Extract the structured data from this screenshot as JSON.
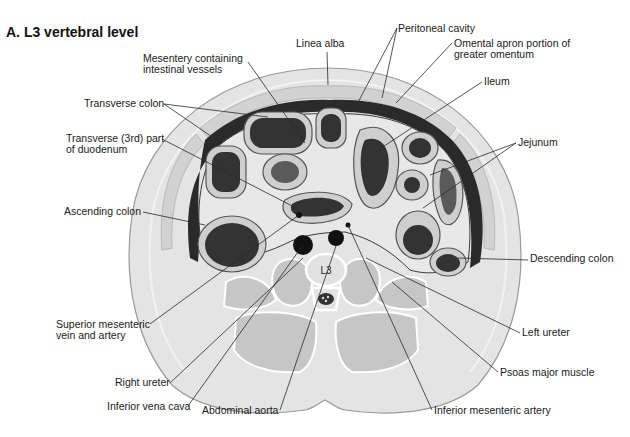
{
  "title": "A. L3 vertebral level",
  "vertebra_label": "L3",
  "labels": [
    {
      "id": "mesentery",
      "lines": [
        "Mesentery containing",
        "intestinal vessels"
      ],
      "x": 143,
      "y": 62,
      "anchor": "start"
    },
    {
      "id": "linea-alba",
      "lines": [
        "Linea alba"
      ],
      "x": 296,
      "y": 47,
      "anchor": "start"
    },
    {
      "id": "peritoneal-cavity",
      "lines": [
        "Peritoneal cavity"
      ],
      "x": 398,
      "y": 32,
      "anchor": "start"
    },
    {
      "id": "omental-apron",
      "lines": [
        "Omental apron portion of",
        "greater omentum"
      ],
      "x": 454,
      "y": 47,
      "anchor": "start"
    },
    {
      "id": "ileum",
      "lines": [
        "Ileum"
      ],
      "x": 484,
      "y": 85,
      "anchor": "start"
    },
    {
      "id": "transverse-colon",
      "lines": [
        "Transverse colon"
      ],
      "x": 84,
      "y": 107,
      "anchor": "start"
    },
    {
      "id": "duodenum",
      "lines": [
        "Transverse (3rd) part",
        "of duodenum"
      ],
      "x": 66,
      "y": 142,
      "anchor": "start"
    },
    {
      "id": "jejunum",
      "lines": [
        "Jejunum"
      ],
      "x": 518,
      "y": 146,
      "anchor": "start"
    },
    {
      "id": "ascending-colon",
      "lines": [
        "Ascending colon"
      ],
      "x": 64,
      "y": 215,
      "anchor": "start"
    },
    {
      "id": "descending-colon",
      "lines": [
        "Descending colon"
      ],
      "x": 530,
      "y": 262,
      "anchor": "start"
    },
    {
      "id": "smv-sma",
      "lines": [
        "Superior mesenteric",
        "vein and artery"
      ],
      "x": 56,
      "y": 328,
      "anchor": "start"
    },
    {
      "id": "left-ureter",
      "lines": [
        "Left ureter"
      ],
      "x": 522,
      "y": 336,
      "anchor": "start"
    },
    {
      "id": "right-ureter",
      "lines": [
        "Right ureter"
      ],
      "x": 115,
      "y": 386,
      "anchor": "start"
    },
    {
      "id": "psoas",
      "lines": [
        "Psoas major muscle"
      ],
      "x": 500,
      "y": 376,
      "anchor": "start"
    },
    {
      "id": "ivc",
      "lines": [
        "Inferior vena cava"
      ],
      "x": 107,
      "y": 410,
      "anchor": "start"
    },
    {
      "id": "aorta",
      "lines": [
        "Abdominal aorta"
      ],
      "x": 202,
      "y": 414,
      "anchor": "start"
    },
    {
      "id": "ima",
      "lines": [
        "Inferior mesenteric artery"
      ],
      "x": 434,
      "y": 414,
      "anchor": "start"
    }
  ],
  "leaders": [
    {
      "for": "mesentery",
      "points": [
        [
          248,
          62
        ],
        [
          305,
          143
        ]
      ]
    },
    {
      "for": "linea-alba",
      "points": [
        [
          327,
          52
        ],
        [
          328,
          85
        ]
      ]
    },
    {
      "for": "peritoneal-cavity",
      "points": [
        [
          397,
          28
        ],
        [
          353,
          112
        ]
      ]
    },
    {
      "for": "peritoneal-cavity",
      "points": [
        [
          397,
          28
        ],
        [
          382,
          98
        ]
      ]
    },
    {
      "for": "omental-apron",
      "points": [
        [
          452,
          43
        ],
        [
          396,
          103
        ]
      ]
    },
    {
      "for": "ileum",
      "points": [
        [
          482,
          82
        ],
        [
          378,
          150
        ]
      ]
    },
    {
      "for": "transverse-colon",
      "points": [
        [
          164,
          104
        ],
        [
          268,
          117
        ]
      ]
    },
    {
      "for": "transverse-colon",
      "points": [
        [
          164,
          104
        ],
        [
          221,
          143
        ]
      ]
    },
    {
      "for": "duodenum",
      "points": [
        [
          162,
          139
        ],
        [
          300,
          210
        ]
      ]
    },
    {
      "for": "jejunum",
      "points": [
        [
          516,
          143
        ],
        [
          430,
          175
        ]
      ]
    },
    {
      "for": "jejunum",
      "points": [
        [
          516,
          143
        ],
        [
          423,
          208
        ]
      ]
    },
    {
      "for": "ascending-colon",
      "points": [
        [
          143,
          212
        ],
        [
          205,
          225
        ]
      ]
    },
    {
      "for": "descending-colon",
      "points": [
        [
          528,
          260
        ],
        [
          458,
          258
        ]
      ]
    },
    {
      "for": "smv-sma",
      "points": [
        [
          150,
          324
        ],
        [
          299,
          215
        ]
      ]
    },
    {
      "for": "left-ureter",
      "points": [
        [
          520,
          333
        ],
        [
          366,
          258
        ]
      ]
    },
    {
      "for": "right-ureter",
      "points": [
        [
          170,
          383
        ],
        [
          303,
          258
        ]
      ]
    },
    {
      "for": "psoas",
      "points": [
        [
          498,
          372
        ],
        [
          392,
          282
        ]
      ]
    },
    {
      "for": "ivc",
      "points": [
        [
          188,
          406
        ],
        [
          303,
          245
        ]
      ]
    },
    {
      "for": "aorta",
      "points": [
        [
          280,
          410
        ],
        [
          336,
          246
        ]
      ]
    },
    {
      "for": "ima",
      "points": [
        [
          432,
          410
        ],
        [
          348,
          225
        ]
      ]
    }
  ],
  "colors": {
    "skin": "#e4e4e4",
    "muscle": "#c6c6c6",
    "lumen": "#333333",
    "vessel": "#111111",
    "text": "#1a1a1a",
    "leader": "#2a2a2a"
  }
}
